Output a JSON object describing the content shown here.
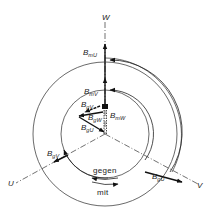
{
  "diagram": {
    "title": "",
    "axes": {
      "u": {
        "label": "U"
      },
      "v": {
        "label": "V"
      },
      "w": {
        "label": "W"
      }
    },
    "vector_labels": {
      "B_mU": {
        "main": "B",
        "sub": "mU"
      },
      "B_mV": {
        "main": "B",
        "sub": "mV"
      },
      "B_mW": {
        "main": "B",
        "sub": "mW"
      },
      "B_gV_inner": {
        "main": "B",
        "sub": "gV"
      },
      "B_gW": {
        "main": "B",
        "sub": "gW"
      },
      "B_gU_inner": {
        "main": "B",
        "sub": "gU"
      },
      "B_gV_outer": {
        "main": "B",
        "sub": "gV"
      },
      "B_gU_outer": {
        "main": "B",
        "sub": "gU"
      }
    },
    "rotation_labels": {
      "gegen": "gegen",
      "mit": "mit"
    },
    "colors": {
      "line": "#222222",
      "background": "#ffffff"
    }
  }
}
